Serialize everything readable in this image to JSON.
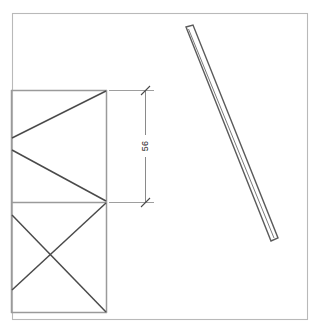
{
  "drawing": {
    "title": "CAD technical drawing view",
    "background_color": "#ffffff",
    "sheet": {
      "name": "sheet-border",
      "x": 12,
      "y": 13,
      "width": 296,
      "height": 307,
      "stroke_color": "#b9b9b9"
    },
    "line_color": "#8d8d8d",
    "detail_color": "#4a4a4a"
  },
  "frame_assembly": {
    "label": "braced frame elevation",
    "left": 11,
    "right": 107,
    "top": 90,
    "middle": 202,
    "bottom": 313,
    "upper_panel": {
      "name": "upper-panel",
      "bracing_type": "chevron-left",
      "apex_upper_y": 138,
      "apex_lower_y": 150
    },
    "lower_panel": {
      "name": "lower-panel",
      "bracing_type": "cross-x",
      "offset_left_top_y": 215,
      "offset_left_bottom_y": 290
    }
  },
  "dimension": {
    "name": "vertical-dimension-56",
    "value": "56",
    "unit": "",
    "orientation": "vertical",
    "text_rotation_deg": -90,
    "line_x": 145,
    "from_y": 90,
    "to_y": 202,
    "extension_start_x": 109,
    "extension_end_x": 154,
    "label_x": 145,
    "label_y": 146,
    "terminator": "tick"
  },
  "tilted_bar": {
    "name": "tilted-bar-member",
    "description": "slender rectangular bar rotated clockwise",
    "top_point": {
      "x": 186,
      "y": 28
    },
    "bottom_point": {
      "x": 271,
      "y": 241
    },
    "thickness": 9,
    "fill_color": "#ffffff",
    "stroke_color": "#5b5b5b"
  }
}
